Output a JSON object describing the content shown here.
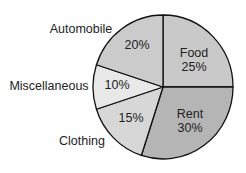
{
  "chart_data": {
    "type": "pie",
    "title": "",
    "start_angle_deg": 0,
    "direction": "clockwise",
    "slices": [
      {
        "label": "Food",
        "value": 25,
        "value_label": "25%",
        "color": "#c9c9c9",
        "label_inside": true
      },
      {
        "label": "Rent",
        "value": 30,
        "value_label": "30%",
        "color": "#b5b5b5",
        "label_inside": true
      },
      {
        "label": "Clothing",
        "value": 15,
        "value_label": "15%",
        "color": "#d7d7d7",
        "label_inside": false
      },
      {
        "label": "Miscellaneous",
        "value": 10,
        "value_label": "10%",
        "color": "#e8e8e8",
        "label_inside": false
      },
      {
        "label": "Automobile",
        "value": 20,
        "value_label": "20%",
        "color": "#cbcbcb",
        "label_inside": false
      }
    ],
    "categories": [
      "Food",
      "Rent",
      "Clothing",
      "Miscellaneous",
      "Automobile"
    ],
    "values": [
      25,
      30,
      15,
      10,
      20
    ],
    "legend": "none"
  },
  "labels": {
    "food_name": "Food",
    "food_pct": "25%",
    "rent_name": "Rent",
    "rent_pct": "30%",
    "clothing_name": "Clothing",
    "clothing_pct": "15%",
    "misc_name": "Miscellaneous",
    "misc_pct": "10%",
    "auto_name": "Automobile",
    "auto_pct": "20%"
  }
}
